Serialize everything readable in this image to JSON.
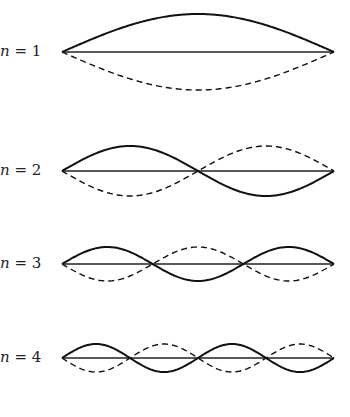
{
  "figure": {
    "type": "standing-wave-modes",
    "x_start": 62,
    "x_end": 334,
    "modes": [
      {
        "n": 1,
        "label_var": "n",
        "label_eq": " = 1",
        "baseline_y": 52,
        "amplitude": 38,
        "label_top": 42
      },
      {
        "n": 2,
        "label_var": "n",
        "label_eq": " = 2",
        "baseline_y": 171,
        "amplitude": 25,
        "label_top": 161
      },
      {
        "n": 3,
        "label_var": "n",
        "label_eq": " = 3",
        "baseline_y": 264,
        "amplitude": 17,
        "label_top": 254
      },
      {
        "n": 4,
        "label_var": "n",
        "label_eq": " = 4",
        "baseline_y": 358,
        "amplitude": 14,
        "label_top": 348
      }
    ],
    "caption": ""
  }
}
